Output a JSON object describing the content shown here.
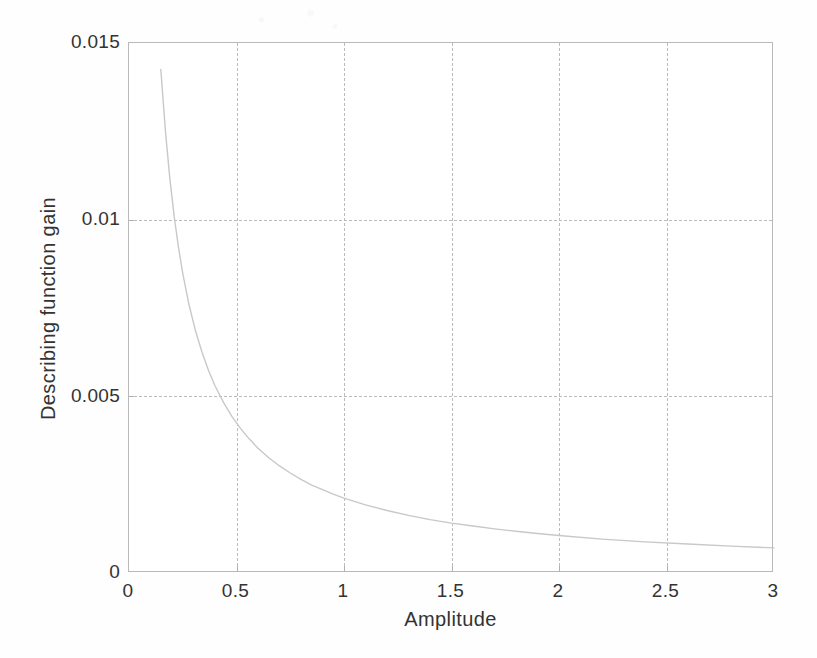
{
  "chart_data": {
    "type": "line",
    "title": "",
    "xlabel": "Amplitude",
    "ylabel": "Describing function gain",
    "xlim": [
      0,
      3
    ],
    "ylim": [
      0,
      0.015
    ],
    "grid": true,
    "legend": null,
    "legend_position": "none",
    "xticks": [
      0,
      0.5,
      1,
      1.5,
      2,
      2.5,
      3
    ],
    "xticklabels": [
      "0",
      "0.5",
      "1",
      "1.5",
      "2",
      "2.5",
      "3"
    ],
    "yticks": [
      0,
      0.005,
      0.01,
      0.015
    ],
    "yticklabels": [
      "0",
      "0.005",
      "0.01",
      "0.015"
    ],
    "line_color": "#c8c8c8",
    "grid_color": "#bcbcbc",
    "axis_color": "#b9b9b9",
    "series": [
      {
        "name": "describing function gain",
        "x": [
          0.148,
          0.17,
          0.19,
          0.21,
          0.23,
          0.25,
          0.28,
          0.31,
          0.34,
          0.37,
          0.4,
          0.44,
          0.48,
          0.52,
          0.56,
          0.6,
          0.65,
          0.7,
          0.75,
          0.8,
          0.85,
          0.9,
          0.95,
          1.0,
          1.1,
          1.2,
          1.3,
          1.4,
          1.5,
          1.6,
          1.7,
          1.8,
          1.9,
          2.0,
          2.2,
          2.4,
          2.6,
          2.8,
          3.0
        ],
        "y": [
          0.01425,
          0.01247,
          0.01116,
          0.0101,
          0.00922,
          0.00848,
          0.00757,
          0.00684,
          0.00624,
          0.00573,
          0.0053,
          0.00482,
          0.00442,
          0.00408,
          0.00379,
          0.00353,
          0.00326,
          0.00303,
          0.00283,
          0.00265,
          0.00249,
          0.00236,
          0.00223,
          0.00212,
          0.00193,
          0.00177,
          0.00163,
          0.00151,
          0.00141,
          0.00133,
          0.00125,
          0.00118,
          0.00112,
          0.00106,
          0.00096,
          0.00088,
          0.00082,
          0.00076,
          0.00071
        ]
      }
    ]
  }
}
